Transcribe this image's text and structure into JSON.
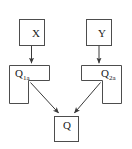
{
  "diagram": {
    "type": "block-flow-diagram",
    "background_color": "#ffffff",
    "stroke_color": "#4d4d4d",
    "text_color": "#1a1a1a",
    "nodes": [
      {
        "id": "x",
        "label": "X",
        "subscript": "",
        "shape": "rectangle"
      },
      {
        "id": "y",
        "label": "Y",
        "subscript": "",
        "shape": "rectangle"
      },
      {
        "id": "q1",
        "label": "Q",
        "subscript": "1a",
        "shape": "l-shape-left"
      },
      {
        "id": "q2",
        "label": "Q",
        "subscript": "2a",
        "shape": "l-shape-right"
      },
      {
        "id": "q",
        "label": "Q",
        "subscript": "",
        "shape": "rectangle"
      }
    ],
    "edges": [
      {
        "from": "x",
        "to": "q1",
        "style": "vertical-arrow"
      },
      {
        "from": "y",
        "to": "q2",
        "style": "vertical-arrow"
      },
      {
        "from": "q1",
        "to": "q",
        "style": "diagonal-arrow"
      },
      {
        "from": "q2",
        "to": "q",
        "style": "diagonal-arrow"
      }
    ]
  }
}
